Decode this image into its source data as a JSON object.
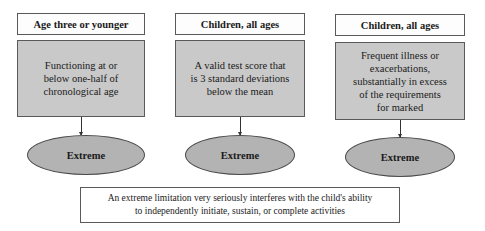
{
  "columns": [
    {
      "header": "Age three or younger",
      "criterion": [
        "Functioning at or",
        "below one-half of",
        "chronological age"
      ],
      "result": "Extreme"
    },
    {
      "header": "Children, all ages",
      "criterion": [
        "A valid test score that",
        "is 3 standard deviations",
        "below the mean"
      ],
      "result": "Extreme"
    },
    {
      "header": "Children, all ages",
      "criterion": [
        "Frequent illness or",
        "exacerbations,",
        "substantially in excess",
        "of the requirements",
        "for marked"
      ],
      "result": "Extreme"
    }
  ],
  "definition": {
    "lines": [
      "An extreme limitation very seriously interferes with the child's ability",
      "to independently initiate, sustain, or complete activities"
    ]
  },
  "colors": {
    "criterion_fill": "#c9c9c9",
    "ellipse_fill": "#b3b3b3",
    "border": "#5a5a5a"
  }
}
